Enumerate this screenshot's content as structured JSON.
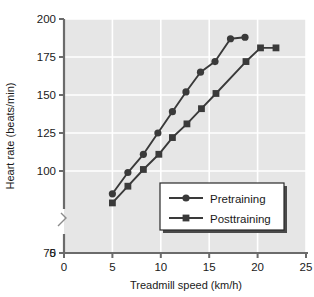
{
  "chart_data": {
    "type": "line",
    "title": "",
    "xlabel": "Treadmill speed (km/h)",
    "ylabel": "Heart rate (beats/min)",
    "xlim": [
      0,
      25
    ],
    "ylim": [
      75,
      200
    ],
    "y_axis_break": true,
    "y_break_from": 0,
    "y_break_to": 75,
    "xticks": [
      0,
      5,
      10,
      15,
      20,
      25
    ],
    "xtick_labels": [
      "0",
      "5",
      "10",
      "15",
      "20",
      "25"
    ],
    "yticks": [
      0,
      75,
      100,
      125,
      150,
      175,
      200
    ],
    "ytick_labels": [
      "0",
      "75",
      "100",
      "125",
      "150",
      "175",
      "200"
    ],
    "grid": true,
    "grid_color": "#ffffff",
    "plot_bg": "#e6e6e6",
    "legend_position": "lower-right",
    "series": [
      {
        "name": "Pretraining",
        "marker": "circle",
        "color": "#3a3a3a",
        "points": [
          {
            "x": 5.0,
            "y": 85
          },
          {
            "x": 6.6,
            "y": 99
          },
          {
            "x": 8.2,
            "y": 111
          },
          {
            "x": 9.7,
            "y": 125
          },
          {
            "x": 11.2,
            "y": 139
          },
          {
            "x": 12.6,
            "y": 152
          },
          {
            "x": 14.1,
            "y": 165
          },
          {
            "x": 15.6,
            "y": 172
          },
          {
            "x": 17.2,
            "y": 187
          },
          {
            "x": 18.7,
            "y": 188
          }
        ]
      },
      {
        "name": "Posttraining",
        "marker": "square",
        "color": "#3a3a3a",
        "points": [
          {
            "x": 5.0,
            "y": 79
          },
          {
            "x": 6.6,
            "y": 90
          },
          {
            "x": 8.2,
            "y": 101
          },
          {
            "x": 9.8,
            "y": 111
          },
          {
            "x": 11.2,
            "y": 122
          },
          {
            "x": 12.7,
            "y": 131
          },
          {
            "x": 14.2,
            "y": 141
          },
          {
            "x": 15.7,
            "y": 151
          },
          {
            "x": 18.8,
            "y": 172
          },
          {
            "x": 20.3,
            "y": 181
          },
          {
            "x": 21.9,
            "y": 181
          }
        ]
      }
    ],
    "legend_entries": [
      {
        "label": "Pretraining",
        "marker": "circle"
      },
      {
        "label": "Posttraining",
        "marker": "square"
      }
    ]
  }
}
